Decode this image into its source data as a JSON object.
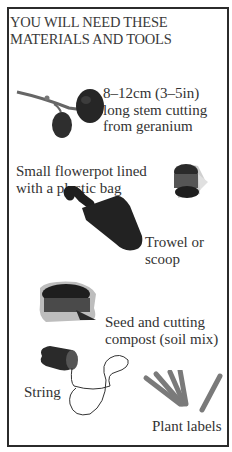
{
  "heading": {
    "line1": "YOU WILL NEED THESE",
    "line2": "MATERIALS AND TOOLS"
  },
  "items": [
    {
      "icon": "geranium-cutting-icon",
      "lines": [
        "8–12cm (3–5in)",
        "long stem cutting",
        "from geranium"
      ]
    },
    {
      "icon": "flowerpot-icon",
      "lines": [
        "Small flowerpot lined",
        "with a plastic bag"
      ]
    },
    {
      "icon": "trowel-icon",
      "lines": [
        "Trowel or",
        "scoop"
      ]
    },
    {
      "icon": "compost-bag-icon",
      "lines": [
        "Seed and cutting",
        "compost (soil mix)"
      ]
    },
    {
      "icon": "string-icon",
      "lines": [
        "String"
      ]
    },
    {
      "icon": "plant-labels-icon",
      "lines": [
        "Plant labels"
      ]
    }
  ],
  "colors": {
    "border": "#2b2b2b",
    "text": "#333333",
    "labels": "#777777"
  }
}
